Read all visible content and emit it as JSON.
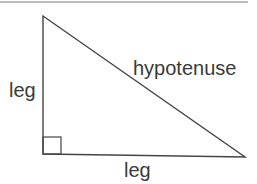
{
  "diagram": {
    "type": "right-triangle",
    "labels": {
      "vertical_leg": "leg",
      "horizontal_leg": "leg",
      "hypotenuse": "hypotenuse"
    },
    "colors": {
      "stroke": "#444444",
      "text": "#3a3a3a",
      "top_rule": "#bdbdbd"
    }
  }
}
